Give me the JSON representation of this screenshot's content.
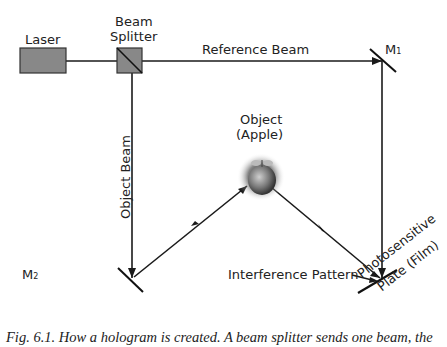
{
  "diagram": {
    "laser_label": "Laser",
    "splitter_label_line1": "Beam",
    "splitter_label_line2": "Splitter",
    "reference_beam_label": "Reference Beam",
    "mirror1_label": "M",
    "mirror1_sub": "1",
    "mirror2_label": "M",
    "mirror2_sub": "2",
    "object_beam_label": "Object Beam",
    "object_label_line1": "Object",
    "object_label_line2": "(Apple)",
    "interference_label": "Interference Pattern",
    "plate_label_line1": "Photosensitive",
    "plate_label_line2": "Plate (Film)",
    "colors": {
      "line": "#1a1a1a",
      "box_fill": "#888888",
      "text": "#222222"
    }
  },
  "caption": "Fig. 6.1. How a hologram is created. A beam splitter sends one beam, the"
}
